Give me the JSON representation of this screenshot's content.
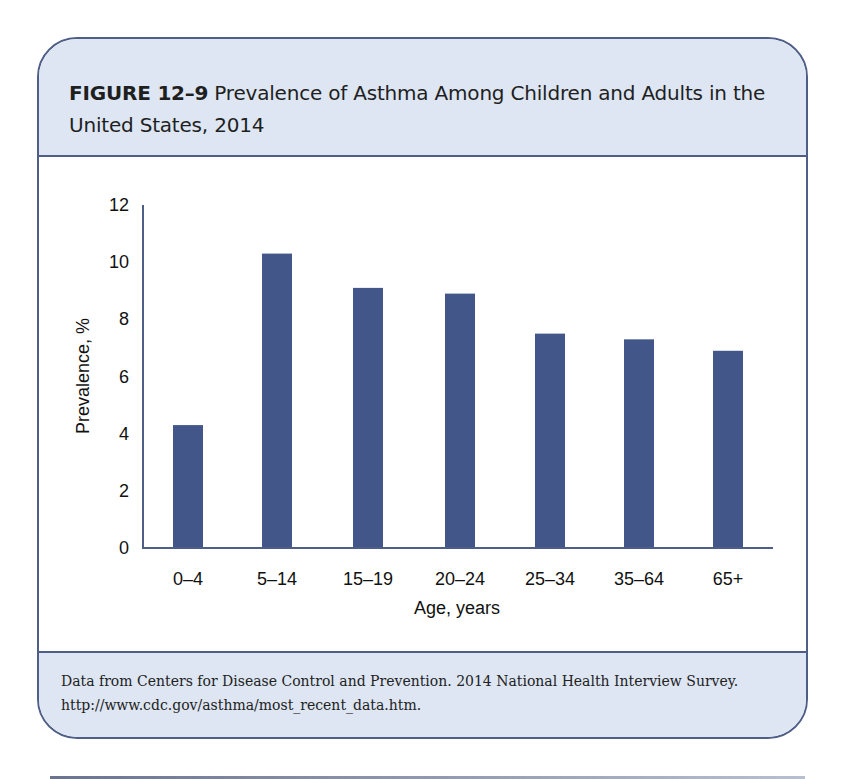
{
  "figure": {
    "label": "FIGURE 12–9",
    "title": "Prevalence of Asthma Among Children and Adults in the United States, 2014",
    "source_line1": "Data from Centers for Disease Control and Prevention. 2014 National Health Interview Survey.",
    "source_line2": "http://www.cdc.gov/asthma/most_recent_data.htm."
  },
  "colors": {
    "bar": "#42568a",
    "frame": "#4f5e86",
    "panel_bg": "#dde6f2",
    "axis": "#4f5e86"
  },
  "chart_data": {
    "type": "bar",
    "title": "Prevalence of Asthma Among Children and Adults in the United States, 2014",
    "xlabel": "Age, years",
    "ylabel": "Prevalence, %",
    "categories": [
      "0–4",
      "5–14",
      "15–19",
      "20–24",
      "25–34",
      "35–64",
      "65+"
    ],
    "values": [
      4.3,
      10.3,
      9.1,
      8.9,
      7.5,
      7.3,
      6.9
    ],
    "yticks": [
      0,
      2,
      4,
      6,
      8,
      10,
      12
    ],
    "ylim": [
      0,
      12
    ],
    "grid": false,
    "legend": null
  }
}
